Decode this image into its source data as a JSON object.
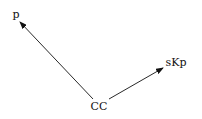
{
  "diagram": {
    "nodes": [
      {
        "id": "cc",
        "label": "CC",
        "x": 99,
        "y": 110
      },
      {
        "id": "p",
        "label": "p",
        "x": 16,
        "y": 18
      },
      {
        "id": "skp",
        "label": "sKp",
        "x": 176,
        "y": 66
      }
    ],
    "edges": [
      {
        "from": "CC",
        "to": "p"
      },
      {
        "from": "CC",
        "to": "sKp"
      }
    ],
    "colors": {
      "line": "#111111",
      "background": "#ffffff"
    }
  }
}
